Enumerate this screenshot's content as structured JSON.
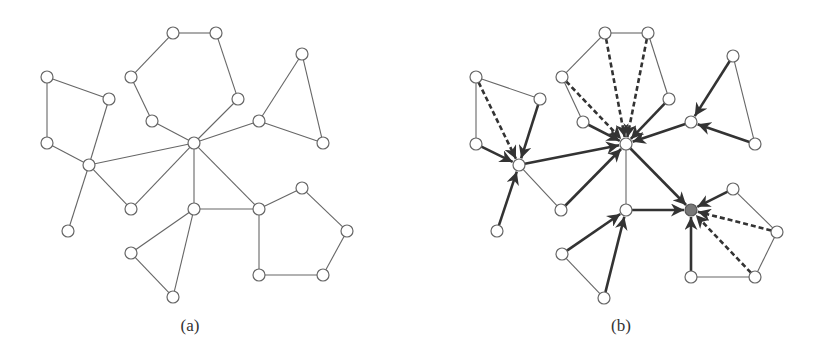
{
  "figure": {
    "panels": [
      {
        "id": "a",
        "label": "(a)",
        "label_pos": [
          190,
          328
        ],
        "nodes": {
          "A1": [
            47,
            77
          ],
          "A2": [
            109,
            99
          ],
          "A3": [
            47,
            143
          ],
          "A4": [
            89,
            165
          ],
          "A5": [
            68,
            231
          ],
          "A6": [
            131,
            209
          ],
          "C": [
            194,
            143
          ],
          "H1": [
            173,
            33
          ],
          "H2": [
            216,
            33
          ],
          "H3": [
            238,
            99
          ],
          "H4": [
            131,
            77
          ],
          "H5": [
            152,
            121
          ],
          "T1": [
            302,
            54
          ],
          "T2": [
            259,
            121
          ],
          "T3": [
            323,
            143
          ],
          "B1": [
            194,
            209
          ],
          "B2": [
            131,
            253
          ],
          "B3": [
            173,
            297
          ],
          "P1": [
            259,
            209
          ],
          "P2": [
            302,
            188
          ],
          "P3": [
            347,
            231
          ],
          "P4": [
            323,
            275
          ],
          "P5": [
            259,
            275
          ]
        },
        "root": null,
        "edges": [
          [
            "A1",
            "A2",
            "thin"
          ],
          [
            "A1",
            "A3",
            "thin"
          ],
          [
            "A3",
            "A4",
            "thin"
          ],
          [
            "A2",
            "A4",
            "thin"
          ],
          [
            "A4",
            "A5",
            "thin"
          ],
          [
            "A4",
            "A6",
            "thin"
          ],
          [
            "A4",
            "C",
            "thin"
          ],
          [
            "A6",
            "C",
            "thin"
          ],
          [
            "C",
            "H5",
            "thin"
          ],
          [
            "H5",
            "H4",
            "thin"
          ],
          [
            "H4",
            "H1",
            "thin"
          ],
          [
            "H1",
            "H2",
            "thin"
          ],
          [
            "H2",
            "H3",
            "thin"
          ],
          [
            "H3",
            "C",
            "thin"
          ],
          [
            "C",
            "T2",
            "thin"
          ],
          [
            "T2",
            "T1",
            "thin"
          ],
          [
            "T1",
            "T3",
            "thin"
          ],
          [
            "T3",
            "T2",
            "thin"
          ],
          [
            "C",
            "B1",
            "thin"
          ],
          [
            "C",
            "P1",
            "thin"
          ],
          [
            "B1",
            "P1",
            "thin"
          ],
          [
            "B1",
            "B2",
            "thin"
          ],
          [
            "B2",
            "B3",
            "thin"
          ],
          [
            "B3",
            "B1",
            "thin"
          ],
          [
            "P1",
            "P2",
            "thin"
          ],
          [
            "P2",
            "P3",
            "thin"
          ],
          [
            "P3",
            "P4",
            "thin"
          ],
          [
            "P4",
            "P5",
            "thin"
          ],
          [
            "P5",
            "P1",
            "thin"
          ]
        ]
      },
      {
        "id": "b",
        "label": "(b)",
        "label_pos": [
          621,
          328
        ],
        "nodes": {
          "A1": [
            476,
            77
          ],
          "A2": [
            540,
            99
          ],
          "A3": [
            476,
            144
          ],
          "A4": [
            519,
            165
          ],
          "A5": [
            497,
            231
          ],
          "A6": [
            561,
            210
          ],
          "C": [
            626,
            144
          ],
          "H1": [
            605,
            33
          ],
          "H2": [
            648,
            33
          ],
          "H3": [
            669,
            99
          ],
          "H4": [
            562,
            77
          ],
          "H5": [
            583,
            122
          ],
          "T1": [
            733,
            56
          ],
          "T2": [
            691,
            122
          ],
          "T3": [
            755,
            144
          ],
          "B1": [
            626,
            210
          ],
          "B2": [
            562,
            254
          ],
          "B3": [
            604,
            298
          ],
          "P1": [
            691,
            210
          ],
          "P2": [
            733,
            189
          ],
          "P3": [
            777,
            232
          ],
          "P4": [
            755,
            277
          ],
          "P5": [
            691,
            277
          ]
        },
        "root": "P1",
        "edges": [
          [
            "A1",
            "A2",
            "thin"
          ],
          [
            "A1",
            "A3",
            "thin"
          ],
          [
            "A4",
            "A6",
            "thin"
          ],
          [
            "A1",
            "A4",
            "dashed"
          ],
          [
            "A2",
            "A4",
            "thick"
          ],
          [
            "A3",
            "A4",
            "thick"
          ],
          [
            "A5",
            "A4",
            "thick"
          ],
          [
            "A4",
            "C",
            "thick"
          ],
          [
            "A6",
            "C",
            "thick"
          ],
          [
            "H5",
            "H4",
            "thin"
          ],
          [
            "H4",
            "H1",
            "thin"
          ],
          [
            "H1",
            "H2",
            "thin"
          ],
          [
            "H2",
            "H3",
            "thin"
          ],
          [
            "H4",
            "C",
            "dashed"
          ],
          [
            "H1",
            "C",
            "dashed"
          ],
          [
            "H2",
            "C",
            "dashed"
          ],
          [
            "H5",
            "C",
            "thick"
          ],
          [
            "H3",
            "C",
            "thick"
          ],
          [
            "T1",
            "T3",
            "thin"
          ],
          [
            "T1",
            "T2",
            "thick"
          ],
          [
            "T3",
            "T2",
            "thick"
          ],
          [
            "T2",
            "C",
            "thick"
          ],
          [
            "C",
            "B1",
            "thin"
          ],
          [
            "C",
            "P1",
            "thick"
          ],
          [
            "B1",
            "P1",
            "thick"
          ],
          [
            "B2",
            "B3",
            "thin"
          ],
          [
            "B2",
            "B1",
            "thick"
          ],
          [
            "B3",
            "B1",
            "thick"
          ],
          [
            "P2",
            "P3",
            "thin"
          ],
          [
            "P3",
            "P4",
            "thin"
          ],
          [
            "P4",
            "P5",
            "thin"
          ],
          [
            "P2",
            "P1",
            "thick"
          ],
          [
            "P3",
            "P1",
            "dashed"
          ],
          [
            "P4",
            "P1",
            "dashed"
          ],
          [
            "P5",
            "P1",
            "thick"
          ]
        ]
      }
    ],
    "node_radius": 6
  }
}
